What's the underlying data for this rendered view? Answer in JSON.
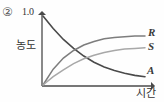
{
  "figure": {
    "number_label": "②",
    "y_axis_title": "농도",
    "x_axis_title": "시간",
    "y_max_label": "1.0"
  },
  "curve_labels": {
    "R": "R",
    "S": "S",
    "A": "A"
  },
  "colors": {
    "axis": "#4a4a4a",
    "curve_A": "#4a4a4a",
    "curve_R": "#7d7d7d",
    "curve_S": "#a8a8a8",
    "background": "#fefefe",
    "text": "#333333"
  },
  "chart_data": {
    "type": "line",
    "title": "",
    "xlabel": "시간",
    "ylabel": "농도",
    "xlim": [
      0,
      1
    ],
    "ylim": [
      0,
      1.0
    ],
    "ytick_labels": [
      "1.0"
    ],
    "yticks": [
      1.0
    ],
    "xtick_labels": [],
    "grid": false,
    "legend": "inline-right-end-labels",
    "x": [
      0,
      0.1,
      0.2,
      0.3,
      0.4,
      0.5,
      0.6,
      0.7,
      0.8,
      0.9,
      1.0
    ],
    "series": [
      {
        "name": "A",
        "label": "A",
        "color": "#4a4a4a",
        "values": [
          1.0,
          0.82,
          0.66,
          0.53,
          0.42,
          0.33,
          0.26,
          0.21,
          0.17,
          0.14,
          0.12
        ]
      },
      {
        "name": "R",
        "label": "R",
        "color": "#7d7d7d",
        "values": [
          0.0,
          0.23,
          0.39,
          0.5,
          0.58,
          0.63,
          0.67,
          0.69,
          0.7,
          0.71,
          0.71
        ]
      },
      {
        "name": "S",
        "label": "S",
        "color": "#a8a8a8",
        "values": [
          0.0,
          0.12,
          0.22,
          0.31,
          0.38,
          0.43,
          0.47,
          0.5,
          0.52,
          0.53,
          0.54
        ]
      }
    ]
  }
}
